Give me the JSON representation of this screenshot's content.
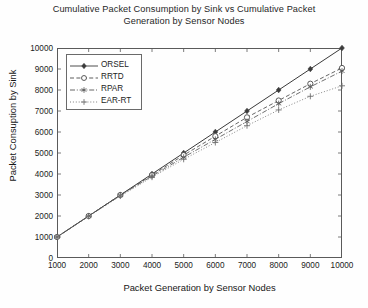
{
  "chart_data": {
    "type": "line",
    "title": "Cumulative Packet Consumption by Sink vs Cumulative Packet Generation by Sensor Nodes",
    "title_line1": "Cumulative Packet Consumption by Sink vs Cumulative Packet",
    "title_line2": "Generation by Sensor Nodes",
    "xlabel": "Packet Generation by Sensor Nodes",
    "ylabel": "Packet Consuption by Sink",
    "x": [
      1000,
      2000,
      3000,
      4000,
      5000,
      6000,
      7000,
      8000,
      9000,
      10000
    ],
    "xlim": [
      1000,
      10000
    ],
    "ylim": [
      0,
      10000
    ],
    "xticks": [
      "1000",
      "2000",
      "3000",
      "4000",
      "5000",
      "6000",
      "7000",
      "8000",
      "9000",
      "10000"
    ],
    "yticks": [
      "0",
      "1000",
      "2000",
      "3000",
      "4000",
      "5000",
      "6000",
      "7000",
      "8000",
      "9000",
      "10000"
    ],
    "grid": false,
    "legend_position": "top-left",
    "series": [
      {
        "name": "ORSEL",
        "marker": "filled-diamond",
        "linestyle": "solid",
        "color": "#3a3a3a",
        "values": [
          1000,
          2000,
          3000,
          4000,
          5000,
          6000,
          7000,
          8000,
          9000,
          10000
        ]
      },
      {
        "name": "RRTD",
        "marker": "open-circle",
        "linestyle": "dashed",
        "color": "#4a4a4a",
        "values": [
          1000,
          2000,
          3000,
          3950,
          4900,
          5800,
          6700,
          7500,
          8300,
          9050
        ]
      },
      {
        "name": "RPAR",
        "marker": "star",
        "linestyle": "dash-dot",
        "color": "#555555",
        "values": [
          1000,
          2000,
          2980,
          3900,
          4800,
          5650,
          6500,
          7350,
          8150,
          8900
        ]
      },
      {
        "name": "EAR-RT",
        "marker": "plus",
        "linestyle": "dotted",
        "color": "#707070",
        "values": [
          1000,
          1980,
          2950,
          3850,
          4700,
          5500,
          6300,
          7050,
          7700,
          8200
        ]
      }
    ]
  }
}
